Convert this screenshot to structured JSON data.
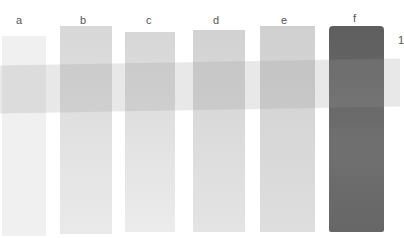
{
  "labels": {
    "a": "a",
    "b": "b",
    "c": "c",
    "d": "d",
    "e": "e",
    "f": "f",
    "row": "1"
  },
  "swatches": [
    {
      "id": "a",
      "color": "#efefef"
    },
    {
      "id": "b",
      "color": "#dcdcdc"
    },
    {
      "id": "c",
      "color": "#dedede"
    },
    {
      "id": "d",
      "color": "#dadada"
    },
    {
      "id": "e",
      "color": "#d6d6d6"
    },
    {
      "id": "f",
      "color": "#6a6a6a"
    }
  ],
  "band_color": "#b0b0b0"
}
